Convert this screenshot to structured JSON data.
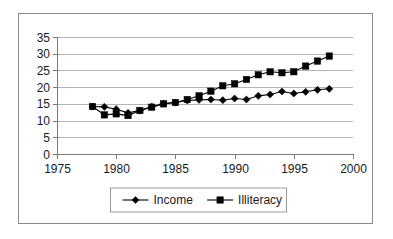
{
  "chart_data": {
    "type": "line",
    "title": "",
    "subtitle": "",
    "xlabel": "",
    "ylabel": "",
    "xlim": [
      1975,
      2000
    ],
    "ylim": [
      0,
      35
    ],
    "x_ticks": [
      1975,
      1980,
      1985,
      1990,
      1995,
      2000
    ],
    "y_ticks": [
      0,
      5,
      10,
      15,
      20,
      25,
      30,
      35
    ],
    "grid": "horizontal",
    "legend_position": "bottom",
    "x": [
      1978,
      1979,
      1980,
      1981,
      1982,
      1983,
      1984,
      1985,
      1986,
      1987,
      1988,
      1989,
      1990,
      1991,
      1992,
      1993,
      1994,
      1995,
      1996,
      1997,
      1998
    ],
    "series": [
      {
        "name": "Income",
        "marker": "diamond",
        "color": "#000000",
        "values": [
          14.2,
          14.1,
          13.4,
          12.3,
          13.0,
          14.2,
          15.1,
          15.4,
          16.0,
          16.2,
          16.3,
          16.1,
          16.6,
          16.3,
          17.4,
          17.8,
          18.7,
          18.1,
          18.6,
          19.2,
          19.5
        ]
      },
      {
        "name": "Illiteracy",
        "marker": "square",
        "color": "#000000",
        "values": [
          14.2,
          11.7,
          12.0,
          11.5,
          13.0,
          14.0,
          15.0,
          15.4,
          16.3,
          17.4,
          18.8,
          20.4,
          21.0,
          22.3,
          23.7,
          24.6,
          24.3,
          24.6,
          26.3,
          27.8,
          29.3
        ]
      }
    ],
    "annotations": []
  },
  "legend": {
    "items": [
      {
        "label": "Income",
        "marker": "diamond"
      },
      {
        "label": "Illiteracy",
        "marker": "square"
      }
    ]
  }
}
